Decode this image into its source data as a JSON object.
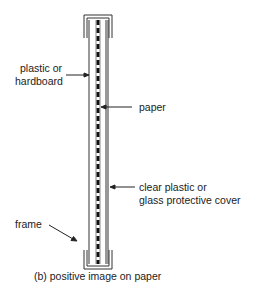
{
  "figure": {
    "caption": "(b) positive image on paper",
    "top_cut_text": "",
    "labels": {
      "backing_line1": "plastic or",
      "backing_line2": "hardboard",
      "paper": "paper",
      "cover_line1": "clear plastic or",
      "cover_line2": "glass protective cover",
      "frame": "frame"
    },
    "colors": {
      "line": "#333333",
      "paper_dash": "#111111",
      "background": "#ffffff"
    }
  }
}
